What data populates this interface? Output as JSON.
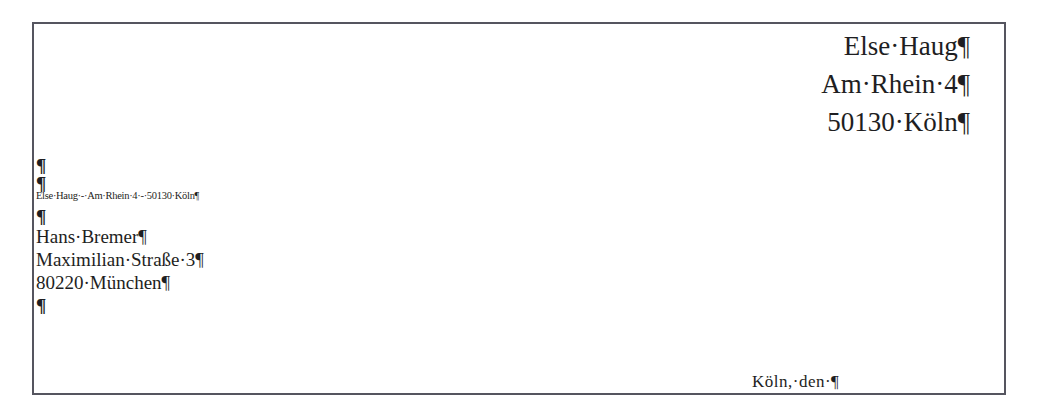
{
  "document": {
    "sender_block": [
      "Else·Haug¶",
      "Am·Rhein·4¶",
      "50130·Köln¶"
    ],
    "empty_paragraphs_before_return": [
      "¶",
      "¶"
    ],
    "return_address_line": "Else·Haug·-·Am·Rhein·4·-·50130·Köln¶",
    "empty_paragraph_after_return": "¶",
    "recipient_block": [
      "Hans·Bremer¶",
      "Maximilian·Straße·3¶",
      "80220·München¶"
    ],
    "empty_paragraph_after_recipient": "¶",
    "date_line": "Köln,·den·¶"
  },
  "colors": {
    "text": "#1e1e22",
    "frame_border": "#55555f",
    "background": "#ffffff"
  }
}
